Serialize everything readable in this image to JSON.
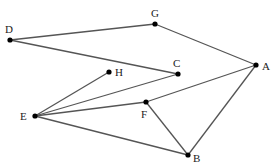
{
  "diagram": {
    "type": "graph",
    "colors": {
      "edge": "#555555",
      "node": "#000000",
      "label": "#222222",
      "background": "#ffffff"
    },
    "nodes": [
      {
        "id": "A",
        "label": "A",
        "x": 256,
        "y": 65,
        "lx": 262,
        "ly": 70
      },
      {
        "id": "B",
        "label": "B",
        "x": 188,
        "y": 155,
        "lx": 193,
        "ly": 162
      },
      {
        "id": "C",
        "label": "C",
        "x": 178,
        "y": 74,
        "lx": 173,
        "ly": 67
      },
      {
        "id": "D",
        "label": "D",
        "x": 10,
        "y": 40,
        "lx": 5,
        "ly": 33
      },
      {
        "id": "E",
        "label": "E",
        "x": 35,
        "y": 116,
        "lx": 20,
        "ly": 120
      },
      {
        "id": "F",
        "label": "F",
        "x": 146,
        "y": 102,
        "lx": 141,
        "ly": 118
      },
      {
        "id": "G",
        "label": "G",
        "x": 155,
        "y": 24,
        "lx": 151,
        "ly": 17
      },
      {
        "id": "H",
        "label": "H",
        "x": 109,
        "y": 72,
        "lx": 115,
        "ly": 76
      }
    ],
    "edges": [
      [
        "D",
        "G"
      ],
      [
        "G",
        "A"
      ],
      [
        "D",
        "C"
      ],
      [
        "C",
        "E"
      ],
      [
        "H",
        "E"
      ],
      [
        "F",
        "E"
      ],
      [
        "E",
        "B"
      ],
      [
        "F",
        "A"
      ],
      [
        "F",
        "B"
      ],
      [
        "A",
        "B"
      ]
    ]
  }
}
